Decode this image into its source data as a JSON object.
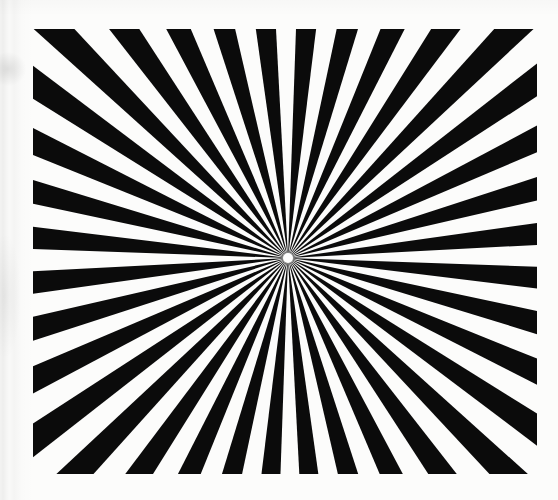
{
  "figure": {
    "kind": "starburst-rays",
    "caption": "",
    "canvas": {
      "width": 558,
      "height": 500
    },
    "background_color": "#fcfcfb",
    "page_color": "#ffffff",
    "ray_color": "#0b0b0b",
    "gap_color": "#fcfcfb",
    "plate": {
      "left": 33,
      "top": 29,
      "right": 537,
      "bottom": 474,
      "width": 504,
      "height": 445
    },
    "center": {
      "x": 288,
      "y": 258
    },
    "rays": {
      "count": 36,
      "sector_count": 72,
      "sector_degrees": 5,
      "start_angle_degrees": 2,
      "duty_cycle": 0.5,
      "core_radius": 5,
      "core_color": "#fdfdfc"
    },
    "artifacts": {
      "left_streak": true,
      "top_haze": true
    }
  }
}
